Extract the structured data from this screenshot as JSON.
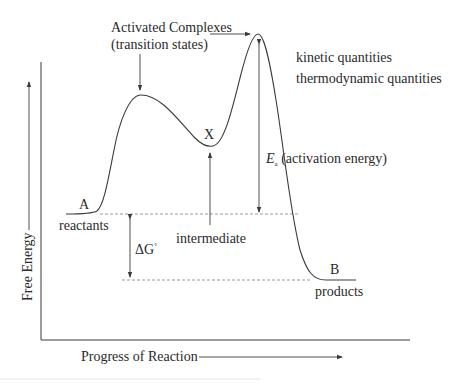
{
  "diagram": {
    "axes": {
      "y_label": "Free Energy",
      "x_label": "Progress of Reaction"
    },
    "labels": {
      "activated_complexes": "Activated Complexes",
      "transition_states": "(transition states)",
      "kinetic": "kinetic quantities",
      "thermodynamic": "thermodynamic quantities",
      "intermediate_symbol": "X",
      "intermediate": "intermediate",
      "ea_symbol": "E",
      "ea_subscript": "a",
      "ea_text": "(activation energy)",
      "delta_g_symbol": "ΔG",
      "delta_g_superscript": "°",
      "reactant_symbol": "A",
      "reactants": "reactants",
      "product_symbol": "B",
      "products": "products"
    },
    "colors": {
      "line": "#3a3a3a",
      "dashed": "#9a9a9a",
      "text": "#2a2a2a",
      "background": "#ffffff"
    }
  }
}
